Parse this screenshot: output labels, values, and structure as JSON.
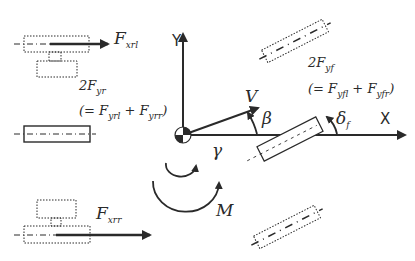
{
  "diagram": {
    "type": "vehicle planar dynamics free-body diagram",
    "axes": {
      "x_label": "X",
      "y_label": "Y"
    },
    "forces": {
      "rear_left_long": {
        "symbol": "F",
        "subscript": "xrl"
      },
      "rear_right_long": {
        "symbol": "F",
        "subscript": "xrr"
      },
      "rear_lateral": {
        "coef": "2",
        "symbol": "F",
        "subscript": "yr",
        "eq_open": "(= ",
        "a": "F",
        "a_sub": "yrl",
        "plus": " + ",
        "b": "F",
        "b_sub": "yrr",
        "eq_close": ")"
      },
      "front_lateral": {
        "coef": "2",
        "symbol": "F",
        "subscript": "yf",
        "eq_open": "(= ",
        "a": "F",
        "a_sub": "yfl",
        "plus": " + ",
        "b": "F",
        "b_sub": "yfr",
        "eq_close": ")"
      }
    },
    "symbols": {
      "velocity": "V",
      "slip_angle": "β",
      "steer_angle": "δ",
      "steer_sub": "f",
      "yaw_rate": "γ",
      "yaw_moment": "M"
    },
    "colors": {
      "ink": "#2a2a2a",
      "background": "#ffffff"
    }
  }
}
